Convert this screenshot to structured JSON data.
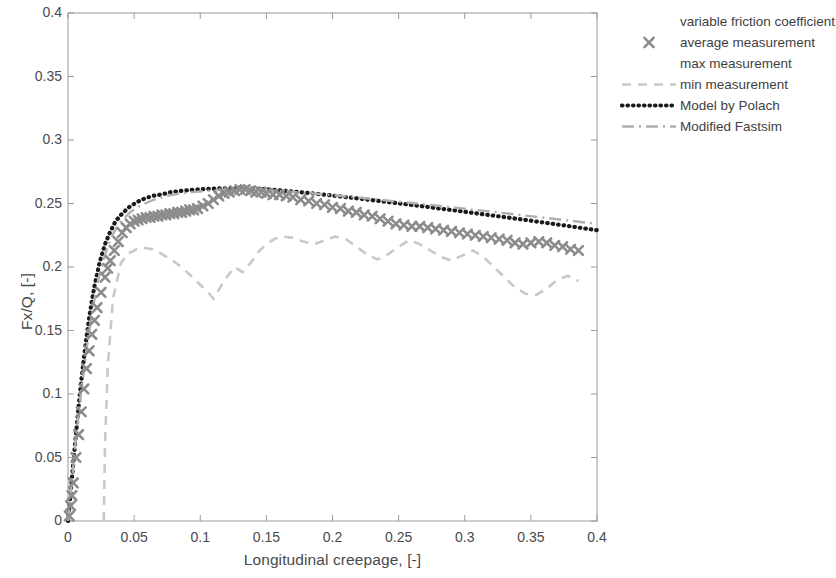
{
  "chart_data": {
    "type": "line",
    "title": "",
    "xlabel": "Longitudinal creepage, [-]",
    "ylabel": "Fx/Q, [-]",
    "xlim": [
      0,
      0.4
    ],
    "ylim": [
      0,
      0.4
    ],
    "xticks": [
      "0",
      "0.05",
      "0.1",
      "0.15",
      "0.2",
      "0.25",
      "0.3",
      "0.35",
      "0.4"
    ],
    "xtick_values": [
      0,
      0.05,
      0.1,
      0.15,
      0.2,
      0.25,
      0.3,
      0.35,
      0.4
    ],
    "yticks": [
      "0",
      "0.05",
      "0.1",
      "0.15",
      "0.2",
      "0.25",
      "0.3",
      "0.35",
      "0.4"
    ],
    "ytick_values": [
      0,
      0.05,
      0.1,
      0.15,
      0.2,
      0.25,
      0.3,
      0.35,
      0.4
    ],
    "grid": false,
    "legend_position": "outside-right-top",
    "legend": [
      {
        "label": "variable friction coefficient",
        "style": "none",
        "color": "#ffffff"
      },
      {
        "label": "average measurement",
        "style": "marker-x",
        "color": "#8c8c8c"
      },
      {
        "label": "max measurement",
        "style": "none",
        "color": "#ffffff"
      },
      {
        "label": "min measurement",
        "style": "dashed",
        "color": "#c8c8c8"
      },
      {
        "label": "Model by Polach",
        "style": "dotted",
        "color": "#1a1a1a"
      },
      {
        "label": "Modified Fastsim",
        "style": "dashdot",
        "color": "#b0b0b0"
      }
    ],
    "series": [
      {
        "name": "Model by Polach",
        "style": "dotted",
        "color": "#1a1a1a",
        "x": [
          0,
          0.002,
          0.004,
          0.006,
          0.008,
          0.01,
          0.012,
          0.014,
          0.016,
          0.018,
          0.02,
          0.024,
          0.028,
          0.032,
          0.036,
          0.04,
          0.046,
          0.052,
          0.058,
          0.064,
          0.07,
          0.078,
          0.086,
          0.094,
          0.102,
          0.11,
          0.12,
          0.13,
          0.14,
          0.15,
          0.16,
          0.175,
          0.19,
          0.205,
          0.22,
          0.235,
          0.25,
          0.265,
          0.28,
          0.295,
          0.31,
          0.325,
          0.34,
          0.355,
          0.37,
          0.385,
          0.4
        ],
        "y": [
          0,
          0.022,
          0.046,
          0.068,
          0.09,
          0.11,
          0.128,
          0.145,
          0.16,
          0.173,
          0.185,
          0.204,
          0.218,
          0.228,
          0.236,
          0.241,
          0.247,
          0.251,
          0.254,
          0.256,
          0.257,
          0.259,
          0.26,
          0.2608,
          0.2613,
          0.2617,
          0.262,
          0.262,
          0.2617,
          0.2612,
          0.2604,
          0.259,
          0.2574,
          0.2557,
          0.2539,
          0.252,
          0.2501,
          0.2482,
          0.2462,
          0.2442,
          0.2421,
          0.24,
          0.2379,
          0.2357,
          0.2335,
          0.2312,
          0.229
        ]
      },
      {
        "name": "Modified Fastsim",
        "style": "dashdot",
        "color": "#b0b0b0",
        "x": [
          0,
          0.003,
          0.006,
          0.01,
          0.014,
          0.018,
          0.022,
          0.026,
          0.03,
          0.035,
          0.04,
          0.048,
          0.056,
          0.065,
          0.075,
          0.085,
          0.095,
          0.105,
          0.118,
          0.13,
          0.145,
          0.16,
          0.18,
          0.2,
          0.22,
          0.24,
          0.26,
          0.28,
          0.3,
          0.32,
          0.34,
          0.36,
          0.38,
          0.4
        ],
        "y": [
          0,
          0.032,
          0.065,
          0.103,
          0.135,
          0.163,
          0.186,
          0.203,
          0.216,
          0.228,
          0.236,
          0.244,
          0.249,
          0.253,
          0.256,
          0.258,
          0.259,
          0.26,
          0.2608,
          0.261,
          0.2606,
          0.2598,
          0.2584,
          0.2566,
          0.2546,
          0.2525,
          0.2504,
          0.2482,
          0.2459,
          0.2436,
          0.2412,
          0.2388,
          0.2364,
          0.234
        ]
      },
      {
        "name": "min measurement",
        "style": "dashed",
        "color": "#c8c8c8",
        "x": [
          0.027,
          0.028,
          0.03,
          0.034,
          0.04,
          0.046,
          0.052,
          0.058,
          0.064,
          0.07,
          0.076,
          0.082,
          0.088,
          0.094,
          0.1,
          0.106,
          0.11,
          0.114,
          0.12,
          0.126,
          0.132,
          0.138,
          0.144,
          0.15,
          0.156,
          0.162,
          0.17,
          0.178,
          0.186,
          0.194,
          0.202,
          0.21,
          0.218,
          0.226,
          0.234,
          0.242,
          0.25,
          0.258,
          0.266,
          0.274,
          0.282,
          0.29,
          0.298,
          0.306,
          0.314,
          0.322,
          0.33,
          0.338,
          0.346,
          0.354,
          0.362,
          0.37,
          0.378,
          0.386
        ],
        "y": [
          0.0,
          0.06,
          0.12,
          0.175,
          0.203,
          0.211,
          0.214,
          0.215,
          0.214,
          0.211,
          0.207,
          0.203,
          0.198,
          0.192,
          0.186,
          0.18,
          0.175,
          0.182,
          0.192,
          0.2,
          0.196,
          0.203,
          0.212,
          0.218,
          0.222,
          0.224,
          0.223,
          0.22,
          0.218,
          0.221,
          0.224,
          0.222,
          0.216,
          0.21,
          0.206,
          0.21,
          0.216,
          0.221,
          0.218,
          0.213,
          0.208,
          0.205,
          0.209,
          0.213,
          0.208,
          0.2,
          0.192,
          0.184,
          0.179,
          0.178,
          0.183,
          0.19,
          0.193,
          0.189
        ]
      },
      {
        "name": "average measurement",
        "style": "marker-x",
        "color": "#8c8c8c",
        "x": [
          0.001,
          0.002,
          0.003,
          0.004,
          0.006,
          0.008,
          0.01,
          0.012,
          0.014,
          0.016,
          0.018,
          0.02,
          0.022,
          0.025,
          0.028,
          0.03,
          0.032,
          0.035,
          0.038,
          0.041,
          0.044,
          0.047,
          0.05,
          0.053,
          0.056,
          0.059,
          0.062,
          0.065,
          0.068,
          0.071,
          0.074,
          0.077,
          0.08,
          0.083,
          0.086,
          0.089,
          0.092,
          0.095,
          0.098,
          0.102,
          0.106,
          0.11,
          0.114,
          0.118,
          0.122,
          0.126,
          0.13,
          0.134,
          0.138,
          0.142,
          0.146,
          0.15,
          0.155,
          0.16,
          0.165,
          0.17,
          0.176,
          0.182,
          0.188,
          0.194,
          0.2,
          0.206,
          0.212,
          0.218,
          0.224,
          0.23,
          0.236,
          0.242,
          0.248,
          0.254,
          0.26,
          0.266,
          0.272,
          0.278,
          0.284,
          0.29,
          0.296,
          0.302,
          0.308,
          0.314,
          0.32,
          0.326,
          0.332,
          0.338,
          0.344,
          0.35,
          0.356,
          0.362,
          0.368,
          0.374,
          0.38,
          0.386
        ],
        "y": [
          0.004,
          0.012,
          0.02,
          0.03,
          0.05,
          0.068,
          0.086,
          0.104,
          0.12,
          0.134,
          0.147,
          0.158,
          0.168,
          0.18,
          0.192,
          0.199,
          0.205,
          0.213,
          0.22,
          0.227,
          0.231,
          0.234,
          0.236,
          0.237,
          0.238,
          0.239,
          0.239,
          0.24,
          0.24,
          0.241,
          0.241,
          0.242,
          0.242,
          0.243,
          0.243,
          0.244,
          0.245,
          0.245,
          0.246,
          0.248,
          0.25,
          0.253,
          0.256,
          0.258,
          0.259,
          0.26,
          0.261,
          0.261,
          0.26,
          0.259,
          0.259,
          0.258,
          0.257,
          0.257,
          0.256,
          0.255,
          0.253,
          0.252,
          0.25,
          0.249,
          0.247,
          0.246,
          0.244,
          0.243,
          0.241,
          0.24,
          0.238,
          0.236,
          0.234,
          0.233,
          0.232,
          0.232,
          0.231,
          0.23,
          0.229,
          0.228,
          0.227,
          0.226,
          0.225,
          0.224,
          0.223,
          0.222,
          0.221,
          0.219,
          0.218,
          0.219,
          0.22,
          0.219,
          0.217,
          0.216,
          0.214,
          0.213
        ]
      }
    ]
  },
  "axes": {
    "xlabel": "Longitudinal creepage, [-]",
    "ylabel": "Fx/Q, [-]"
  },
  "colors": {
    "polach": "#1a1a1a",
    "fastsim": "#b0b0b0",
    "min": "#c8c8c8",
    "marker": "#8c8c8c",
    "axis": "#8a8a8a",
    "text": "#4a4a4a"
  }
}
